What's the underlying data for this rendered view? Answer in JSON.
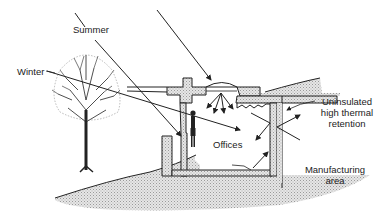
{
  "diagram": {
    "type": "earth-sheltered building solar section",
    "labels": {
      "summer": "Summer",
      "winter": "Winter",
      "offices": "Offices",
      "uninsulated_line1": "Uninsulated",
      "uninsulated_line2": "high thermal",
      "uninsulated_line3": "retention",
      "manufacturing_line1": "Manufacturing",
      "manufacturing_line2": "area"
    },
    "elements": [
      "sun-ray-summer",
      "sun-ray-winter",
      "skylight",
      "tree",
      "person",
      "earth-berm",
      "building-section",
      "reflected-rays"
    ],
    "colors": {
      "line": "#222222",
      "earth_fill": "#d8d8d8",
      "background": "#ffffff"
    }
  }
}
